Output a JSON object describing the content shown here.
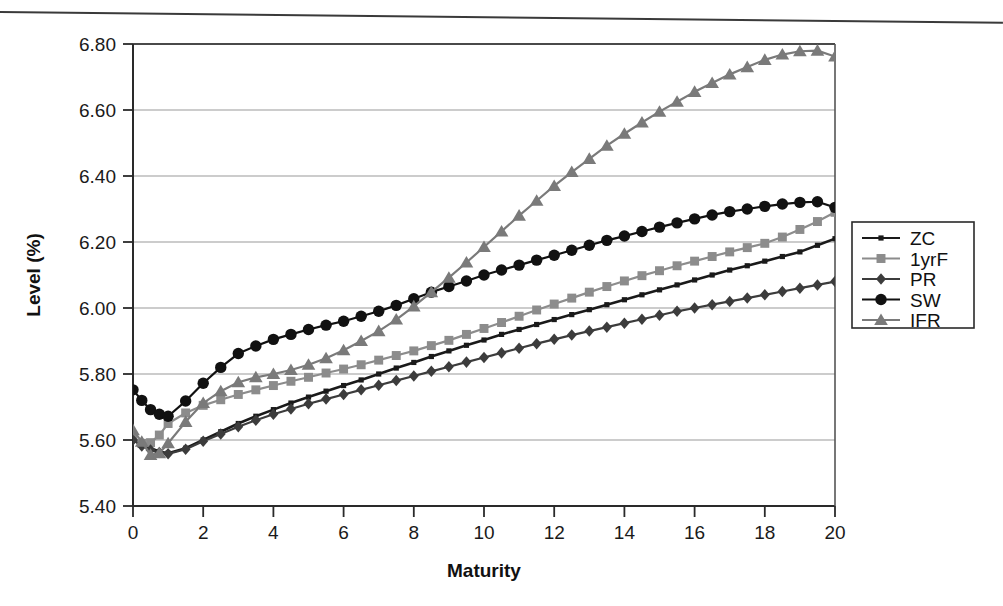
{
  "chart_data": {
    "type": "line",
    "title": "",
    "xlabel": "Maturity",
    "ylabel": "Level (%)",
    "xlim": [
      0,
      20
    ],
    "ylim": [
      5.4,
      6.8
    ],
    "xticks": [
      "0",
      "2",
      "4",
      "6",
      "8",
      "10",
      "12",
      "14",
      "16",
      "18",
      "20"
    ],
    "yticks": [
      "5.40",
      "5.60",
      "5.80",
      "6.00",
      "6.20",
      "6.40",
      "6.60",
      "6.80"
    ],
    "grid": "horizontal",
    "legend_position": "right",
    "x": [
      0,
      0.25,
      0.5,
      0.75,
      1,
      1.5,
      2,
      2.5,
      3,
      3.5,
      4,
      4.5,
      5,
      5.5,
      6,
      6.5,
      7,
      7.5,
      8,
      8.5,
      9,
      9.5,
      10,
      10.5,
      11,
      11.5,
      12,
      12.5,
      13,
      13.5,
      14,
      14.5,
      15,
      15.5,
      16,
      16.5,
      17,
      17.5,
      18,
      18.5,
      19,
      19.5,
      20
    ],
    "series": [
      {
        "name": "ZC",
        "marker": "square",
        "color": "#1a1a1a",
        "values": [
          5.6,
          5.585,
          5.575,
          5.565,
          5.56,
          5.575,
          5.6,
          5.625,
          5.65,
          5.672,
          5.692,
          5.712,
          5.73,
          5.748,
          5.765,
          5.782,
          5.8,
          5.818,
          5.835,
          5.853,
          5.87,
          5.887,
          5.903,
          5.92,
          5.935,
          5.95,
          5.965,
          5.98,
          5.995,
          6.01,
          6.025,
          6.04,
          6.055,
          6.07,
          6.085,
          6.1,
          6.115,
          6.128,
          6.142,
          6.156,
          6.17,
          6.19,
          6.21
        ]
      },
      {
        "name": "1yrF",
        "marker": "square",
        "color": "#8c8c8c",
        "values": [
          5.605,
          5.59,
          5.592,
          5.615,
          5.65,
          5.682,
          5.705,
          5.722,
          5.738,
          5.752,
          5.765,
          5.778,
          5.79,
          5.803,
          5.815,
          5.828,
          5.842,
          5.856,
          5.87,
          5.886,
          5.902,
          5.92,
          5.938,
          5.956,
          5.975,
          5.994,
          6.012,
          6.03,
          6.048,
          6.065,
          6.082,
          6.098,
          6.113,
          6.128,
          6.142,
          6.156,
          6.17,
          6.183,
          6.196,
          6.215,
          6.238,
          6.262,
          6.29
        ]
      },
      {
        "name": "PR",
        "marker": "diamond",
        "color": "#3c3c3c",
        "values": [
          5.6,
          5.582,
          5.57,
          5.562,
          5.558,
          5.572,
          5.596,
          5.618,
          5.64,
          5.66,
          5.678,
          5.694,
          5.71,
          5.724,
          5.738,
          5.752,
          5.766,
          5.78,
          5.794,
          5.808,
          5.822,
          5.836,
          5.85,
          5.864,
          5.878,
          5.892,
          5.905,
          5.918,
          5.93,
          5.942,
          5.954,
          5.966,
          5.978,
          5.99,
          6.0,
          6.01,
          6.02,
          6.03,
          6.04,
          6.05,
          6.06,
          6.07,
          6.08
        ]
      },
      {
        "name": "SW",
        "marker": "circle",
        "color": "#111111",
        "values": [
          5.752,
          5.72,
          5.692,
          5.678,
          5.672,
          5.718,
          5.772,
          5.82,
          5.862,
          5.885,
          5.905,
          5.92,
          5.935,
          5.948,
          5.96,
          5.975,
          5.99,
          6.008,
          6.028,
          6.048,
          6.065,
          6.082,
          6.1,
          6.115,
          6.13,
          6.145,
          6.16,
          6.175,
          6.19,
          6.205,
          6.218,
          6.232,
          6.245,
          6.258,
          6.27,
          6.282,
          6.292,
          6.3,
          6.308,
          6.315,
          6.32,
          6.322,
          6.305
        ]
      },
      {
        "name": "IFR",
        "marker": "triangle",
        "color": "#7a7a7a",
        "values": [
          5.63,
          5.595,
          5.555,
          5.56,
          5.59,
          5.655,
          5.712,
          5.748,
          5.775,
          5.79,
          5.8,
          5.812,
          5.828,
          5.848,
          5.872,
          5.9,
          5.93,
          5.965,
          6.005,
          6.048,
          6.092,
          6.138,
          6.185,
          6.232,
          6.28,
          6.325,
          6.37,
          6.412,
          6.452,
          6.492,
          6.528,
          6.562,
          6.595,
          6.625,
          6.655,
          6.682,
          6.708,
          6.73,
          6.752,
          6.768,
          6.778,
          6.78,
          6.762
        ]
      }
    ]
  },
  "legend": {
    "items": [
      {
        "label": "ZC"
      },
      {
        "label": "1yrF"
      },
      {
        "label": "PR"
      },
      {
        "label": "SW"
      },
      {
        "label": "IFR"
      }
    ]
  }
}
